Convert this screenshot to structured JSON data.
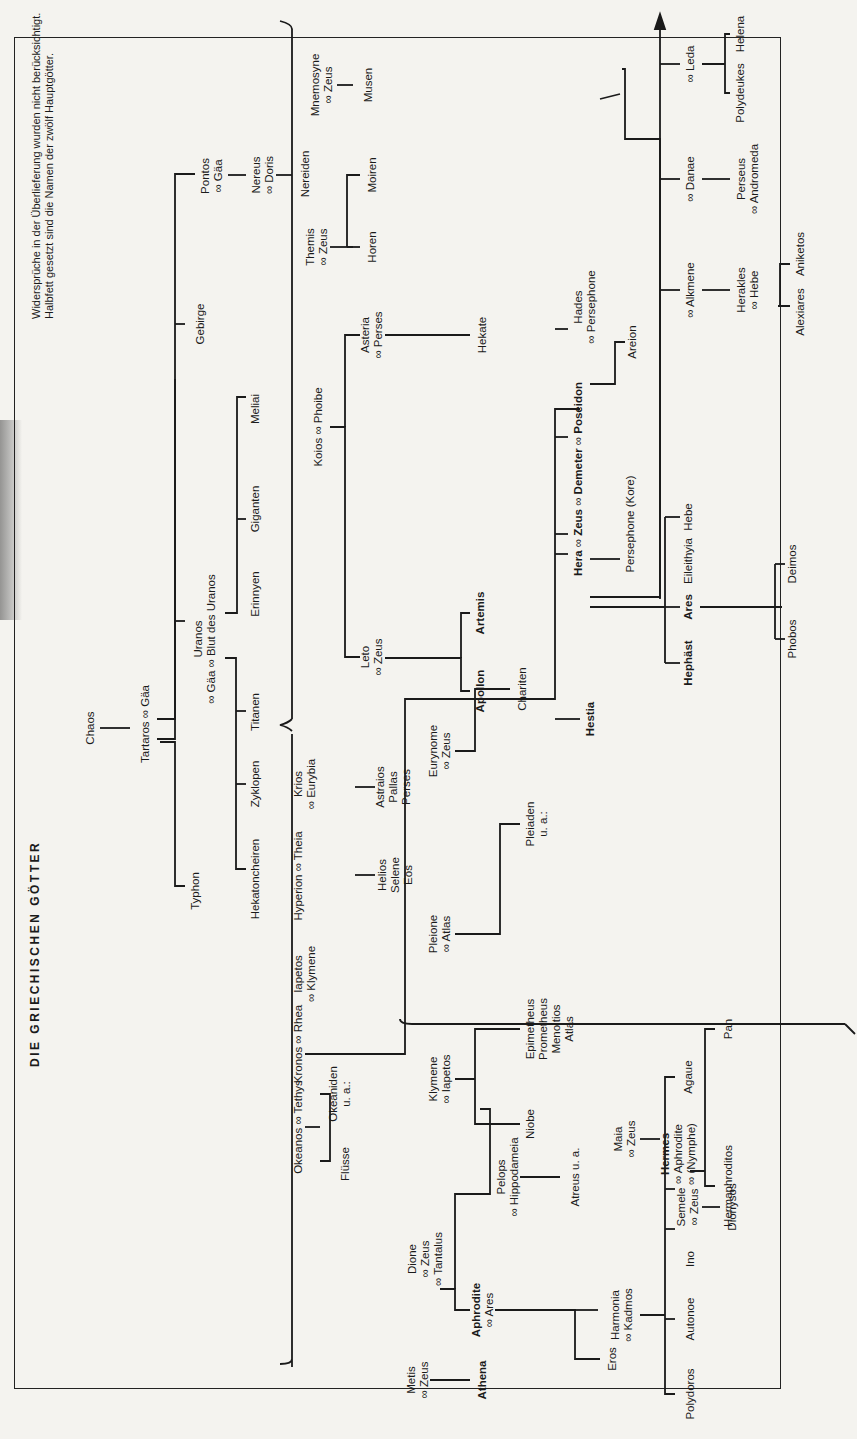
{
  "title": "DIE GRIECHISCHEN GÖTTER",
  "note": {
    "line1": "Widersprüche in der Überlieferung wurden nicht berücksichtigt.",
    "line2": "Halbfett gesetzt sind die Namen der zwölf Hauptgötter."
  },
  "marriage_symbol": "∞",
  "nodes": {
    "chaos": "Chaos",
    "tartaros_gaa": "Tartaros ∞ Gäa",
    "typhon": "Typhon",
    "uranos": "Uranos",
    "uranos_spouse": "∞ Gäa ∞ Blut des Uranos",
    "gebirge": "Gebirge",
    "pontos": "Pontos",
    "pontos_spouse": "∞ Gäa",
    "nereus": "Nereus",
    "nereus_spouse": "∞ Doris",
    "nereiden": "Nereiden",
    "hekatoncheiren": "Hekatoncheiren",
    "zyklopen": "Zyklopen",
    "titanen": "Titanen",
    "erinnyen": "Erinnyen",
    "giganten": "Giganten",
    "meliai": "Meliai",
    "okeanos_tethys": "Okeanos ∞ Tethys",
    "flusse": "Flüsse",
    "okeaniden": "Okeaniden",
    "okeaniden_ua": "u. a.:",
    "iapetos": "Iapetos",
    "iapetos_spouse": "∞ Klymene",
    "kronos_rhea": "Kronos ∞ Rhea",
    "hyperion_theia": "Hyperion ∞ Theia",
    "helios": "Helios",
    "selene": "Selene",
    "eos": "Eos",
    "krios": "Krios",
    "krios_spouse": "∞ Eurybia",
    "astraios": "Astraios",
    "pallas": "Pallas",
    "perses": "Perses",
    "koios_phoibe": "Koios ∞ Phoibe",
    "leto": "Leto",
    "leto_spouse": "∞ Zeus",
    "apollon": "Apollon",
    "artemis": "Artemis",
    "asteria": "Asteria",
    "asteria_spouse": "∞ Perses",
    "hekate": "Hekate",
    "themis": "Themis",
    "themis_spouse": "∞ Zeus",
    "horen": "Horen",
    "moiren": "Moiren",
    "mnemosyne": "Mnemosyne",
    "mnemosyne_spouse": "∞ Zeus",
    "musen": "Musen",
    "metis": "Metis",
    "metis_spouse": "∞ Zeus",
    "athena": "Athena",
    "aphrodite": "Aphrodite",
    "aphrodite_spouse": "∞ Ares",
    "dione": "Dione",
    "dione_spouse1": "∞ Zeus",
    "dione_spouse2": "∞ Tantalus",
    "pelops": "Pelops",
    "pelops_spouse": "∞ Hippodameia",
    "atreus": "Atreus u. a.",
    "eros": "Eros",
    "harmonia": "Harmonia",
    "harmonia_spouse": "∞ Kadmos",
    "polydoros": "Polydoros",
    "autonoe": "Autonoe",
    "ino": "Ino",
    "semele": "Semele",
    "semele_spouse": "∞ Zeus",
    "dionysos": "Dionysos",
    "agaue": "Agaue",
    "klymene": "Klymene",
    "klymene_spouse": "∞ Iapetos",
    "niobe": "Niobe",
    "epimetheus": "Epimetheus",
    "prometheus": "Prometheus",
    "menoitios": "Menoitios",
    "atlas": "Atlas",
    "pleione": "Pleione",
    "pleione_spouse": "∞ Atlas",
    "pleiaden": "Pleiaden",
    "pleiaden_ua": "u. a.:",
    "maia": "Maia",
    "maia_spouse": "∞ Zeus",
    "hermes": "Hermes",
    "hermes_spouse1": "∞ Aphrodite",
    "hermes_spouse2": "∞ (Nymphe)",
    "hermaphroditos": "Hermaphroditos",
    "pan": "Pan",
    "eurynome": "Eurynome",
    "eurynome_spouse": "∞ Zeus",
    "chariten": "Chariten",
    "hestia": "Hestia",
    "hera": "Hera",
    "zeus": "Zeus",
    "demeter": "Demeter",
    "poseidon": "Poseidon",
    "marriage_sep": " ∞ ",
    "hephast": "Hephäst",
    "ares": "Ares",
    "eileithyia": "Eileithyia",
    "hebe": "Hebe",
    "phobos": "Phobos",
    "deimos": "Deimos",
    "persephone_kore": "Persephone (Kore)",
    "areion": "Areion",
    "hades": "Hades",
    "hades_spouse": "∞ Persephone",
    "alkmene": "∞ Alkmene",
    "herakles": "Herakles",
    "herakles_spouse": "∞ Hebe",
    "alexiares": "Alexiares",
    "aniketos": "Aniketos",
    "danae": "∞ Danae",
    "perseus": "Perseus",
    "perseus_spouse": "∞ Andromeda",
    "leda": "∞ Leda",
    "polydeukes": "Polydeukes",
    "helena": "Helena"
  }
}
